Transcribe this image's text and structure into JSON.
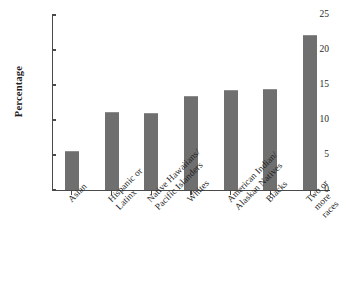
{
  "chart_data": {
    "type": "bar",
    "title": "",
    "subtitle": "",
    "xlabel": "",
    "ylabel": "Percentage",
    "categories": [
      "Asian",
      "Hispanic or\nLatinx",
      "Native Hawaiians/\nPacific Islanders",
      "Whites",
      "American Indian/\nAlaskan Natives",
      "Blacks",
      "Two or more races"
    ],
    "values": [
      5.6,
      11.1,
      11.0,
      13.5,
      14.3,
      14.4,
      22.2
    ],
    "ylim": [
      0,
      25
    ],
    "yticks": [
      0,
      5,
      10,
      15,
      20,
      25
    ],
    "ytick_labels": [
      "0",
      "5",
      "10",
      "15",
      "20",
      "25"
    ],
    "grid": false,
    "legend": false,
    "legend_position": "none",
    "bar_color": "#6f6f6f",
    "axis_color": "#4a4a4a",
    "background_color": "#ffffff"
  }
}
